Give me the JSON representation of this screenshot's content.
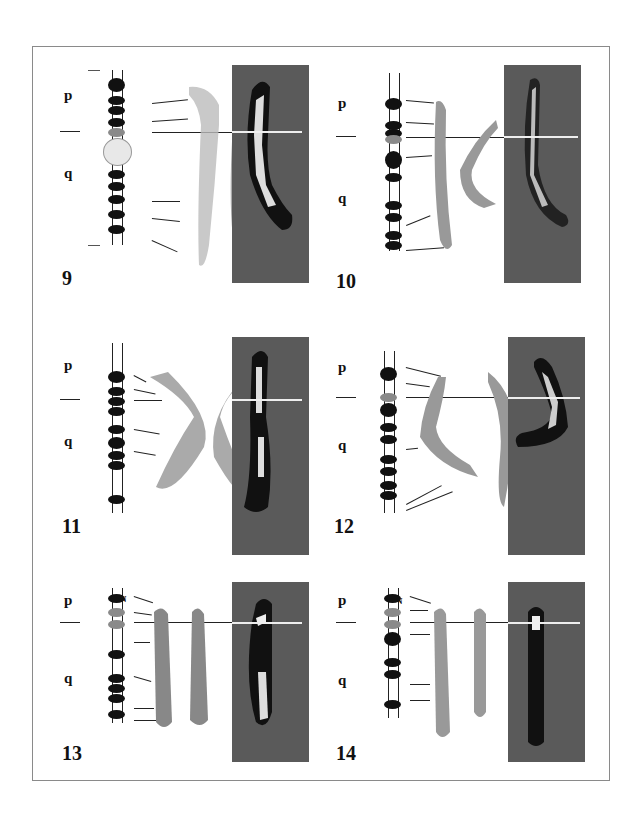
{
  "figure": {
    "panels": [
      {
        "id": "9",
        "label": "9",
        "p_label": "p",
        "q_label": "q",
        "extra_label": "P",
        "left": 64,
        "top": 65
      },
      {
        "id": "10",
        "label": "10",
        "p_label": "p",
        "q_label": "q",
        "extra_label": "",
        "left": 336,
        "top": 65
      },
      {
        "id": "11",
        "label": "11",
        "p_label": "p",
        "q_label": "q",
        "extra_label": "",
        "left": 64,
        "top": 337
      },
      {
        "id": "12",
        "label": "12",
        "p_label": "p",
        "q_label": "q",
        "extra_label": "",
        "left": 336,
        "top": 337
      },
      {
        "id": "13",
        "label": "13",
        "p_label": "p",
        "q_label": "q",
        "extra_label": "N",
        "left": 64,
        "top": 582
      },
      {
        "id": "14",
        "label": "14",
        "p_label": "p",
        "q_label": "q",
        "extra_label": "N",
        "left": 336,
        "top": 582
      }
    ],
    "colors": {
      "dark_panel": "#5a5a5a",
      "frame": "#8a8a8a",
      "band": "#111111",
      "nor_band": "#8a8a8a"
    }
  }
}
